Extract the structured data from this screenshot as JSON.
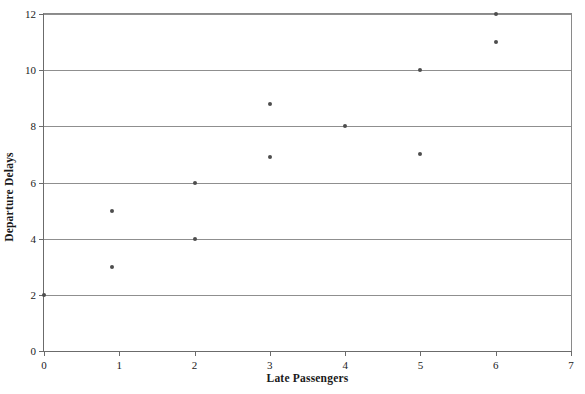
{
  "chart_data": {
    "type": "scatter",
    "title": "",
    "subtitle": "",
    "xlabel": "Late Passengers",
    "ylabel": "Departure Delays",
    "xlim": [
      0,
      7
    ],
    "ylim": [
      0,
      12
    ],
    "xticks": [
      0,
      1,
      2,
      3,
      4,
      5,
      6,
      7
    ],
    "xtick_labels": [
      "0",
      "1",
      "2",
      "3",
      "4",
      "5",
      "6",
      "7"
    ],
    "yticks": [
      0,
      2,
      4,
      6,
      8,
      10,
      12
    ],
    "ytick_labels": [
      "0",
      "2",
      "4",
      "6",
      "8",
      "10",
      "12"
    ],
    "grid": "horizontal",
    "gridlines_y": [
      2,
      4,
      6,
      8,
      10,
      12
    ],
    "legend": null,
    "legend_position": "none",
    "marker": "filled-circle",
    "marker_color": "#4d4d4d",
    "marker_size_px": 4,
    "points": [
      {
        "x": 0,
        "y": 2
      },
      {
        "x": 0.9,
        "y": 3
      },
      {
        "x": 0.9,
        "y": 5
      },
      {
        "x": 2,
        "y": 4
      },
      {
        "x": 2,
        "y": 6
      },
      {
        "x": 3,
        "y": 6.9
      },
      {
        "x": 3,
        "y": 8.8
      },
      {
        "x": 4,
        "y": 8
      },
      {
        "x": 5,
        "y": 7
      },
      {
        "x": 5,
        "y": 10
      },
      {
        "x": 6,
        "y": 11
      },
      {
        "x": 6,
        "y": 12
      }
    ],
    "colors": {
      "marker": "#4d4d4d",
      "gridline": "#8f8f8f",
      "axis": "#6b6b6b",
      "background": "#ffffff",
      "text": "#1a1a1a"
    }
  }
}
